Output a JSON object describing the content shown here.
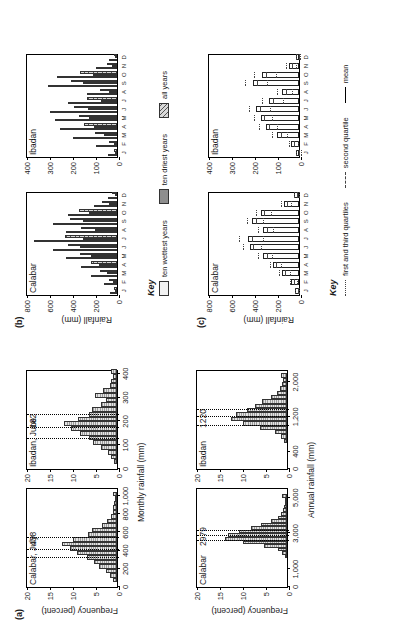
{
  "figure": {
    "orientation": "rotated-90-ccw",
    "panels": [
      "(a)",
      "(b)",
      "(c)"
    ]
  },
  "panel_a": {
    "tag": "(a)",
    "ylabel": "Frequency (percent)",
    "xlabel_top": "Monthly rainfall (mm)",
    "xlabel_bottom": "Annual rainfall (mm)",
    "charts": [
      {
        "id": "calabar-july",
        "title": "Calabar, July",
        "annotation": "438",
        "xlabel": "Monthly rainfall (mm)",
        "ylabel": "Frequency (percent)"
      },
      {
        "id": "ibadan-june",
        "title": "Ibadan, June",
        "annotation": "182",
        "xlabel": "Monthly rainfall (mm)",
        "ylabel": "Frequency (percent)"
      },
      {
        "id": "calabar-annual",
        "title": "Calabar",
        "annotation": "2979",
        "xlabel": "Annual rainfall (mm)",
        "ylabel": "Frequency (percent)"
      },
      {
        "id": "ibadan-annual",
        "title": "Ibadan",
        "annotation": "1220",
        "xlabel": "Annual rainfall (mm)",
        "ylabel": "Frequency (percent)"
      }
    ]
  },
  "panel_b": {
    "tag": "(b)",
    "ylabel": "Rainfall (mm)",
    "key_title": "Key",
    "key_items": [
      {
        "label": "ten wettest years",
        "fill": "fine-dots"
      },
      {
        "label": "ten driest years",
        "fill": "solid-gray"
      },
      {
        "label": "all years",
        "fill": "diagonal-hatch"
      }
    ],
    "charts": [
      {
        "id": "b-calabar",
        "title": "Calabar"
      },
      {
        "id": "b-ibadan",
        "title": "Ibadan"
      }
    ]
  },
  "panel_c": {
    "tag": "(c)",
    "ylabel": "Rainfall (mm)",
    "key_title": "Key",
    "key_items": [
      {
        "label": "first and third quartiles",
        "style": "dotted"
      },
      {
        "label": "second quartile",
        "style": "dashed"
      },
      {
        "label": "mean",
        "style": "solid"
      }
    ],
    "charts": [
      {
        "id": "c-calabar",
        "title": "Calabar"
      },
      {
        "id": "c-ibadan",
        "title": "Ibadan"
      }
    ]
  },
  "chart_data": [
    {
      "id": "calabar-july",
      "type": "bar",
      "title": "Calabar, July",
      "annotation": "438",
      "xlabel": "Monthly rainfall (mm)",
      "ylabel": "Frequency (percent)",
      "xlim": [
        0,
        1100
      ],
      "ylim": [
        0,
        20
      ],
      "xticks": [
        0,
        200,
        400,
        600,
        800,
        1000
      ],
      "xticklabels": [
        "0",
        "200",
        "400",
        "600",
        "800",
        "1,000"
      ],
      "yticks": [
        0,
        5,
        10,
        15,
        20
      ],
      "yticklabels": [
        "0",
        "5",
        "10",
        "15",
        "20"
      ],
      "bin_width": 50,
      "bin_starts": [
        50,
        100,
        150,
        200,
        250,
        300,
        350,
        400,
        450,
        500,
        550,
        600,
        650,
        700,
        750,
        800,
        850,
        900,
        950,
        1000
      ],
      "values": [
        0.8,
        1.6,
        2.5,
        4.0,
        5.0,
        6.5,
        8.6,
        10.2,
        12.0,
        9.6,
        6.4,
        5.4,
        3.2,
        2.2,
        1.4,
        0.9,
        0.8,
        0.6,
        0.5,
        0.9
      ],
      "stat_lines": {
        "first_quartile": 330,
        "second_quartile": 420,
        "third_quartile": 545
      }
    },
    {
      "id": "ibadan-june",
      "type": "bar",
      "title": "Ibadan, June",
      "annotation": "182",
      "xlabel": "Monthly rainfall (mm)",
      "ylabel": "Frequency (percent)",
      "xlim": [
        0,
        420
      ],
      "ylim": [
        0,
        20
      ],
      "xticks": [
        0,
        100,
        200,
        300,
        400
      ],
      "xticklabels": [
        "0",
        "100",
        "200",
        "300",
        "400"
      ],
      "yticks": [
        0,
        5,
        10,
        15,
        20
      ],
      "yticklabels": [
        "0",
        "5",
        "10",
        "15",
        "20"
      ],
      "bin_width": 20,
      "bin_starts": [
        20,
        40,
        60,
        80,
        100,
        120,
        140,
        160,
        180,
        200,
        220,
        240,
        260,
        280,
        300,
        320,
        340,
        360,
        380,
        400
      ],
      "values": [
        0.6,
        1.3,
        2.0,
        3.4,
        5.2,
        6.0,
        8.0,
        9.9,
        11.5,
        8.4,
        6.0,
        5.4,
        3.5,
        2.4,
        4.8,
        3.0,
        1.6,
        1.2,
        0.8,
        1.3
      ],
      "stat_lines": {
        "first_quartile": 130,
        "second_quartile": 178,
        "third_quartile": 232
      }
    },
    {
      "id": "calabar-annual",
      "type": "bar",
      "title": "Calabar",
      "annotation": "2979",
      "xlabel": "Annual rainfall (mm)",
      "ylabel": "Frequency (percent)",
      "xlim": [
        0,
        5600
      ],
      "ylim": [
        0,
        20
      ],
      "xticks": [
        0,
        1000,
        3000,
        5000
      ],
      "xticklabels": [
        "0",
        "1,000",
        "3,000",
        "5,000"
      ],
      "yticks": [
        0,
        5,
        10,
        15,
        20
      ],
      "yticklabels": [
        "0",
        "5",
        "10",
        "15",
        "20"
      ],
      "bin_width": 200,
      "bin_starts": [
        1600,
        1800,
        2000,
        2200,
        2400,
        2600,
        2800,
        3000,
        3200,
        3400,
        3600,
        3800,
        4000,
        4200,
        4400,
        4600,
        4800,
        5000
      ],
      "values": [
        0.5,
        1.0,
        2.0,
        5.0,
        9.6,
        13.4,
        12.8,
        10.4,
        7.8,
        5.6,
        3.4,
        2.0,
        1.2,
        0.8,
        0.6,
        0.4,
        0.4,
        1.0
      ],
      "stat_lines": {
        "first_quartile": 2620,
        "second_quartile": 2930,
        "third_quartile": 3180
      }
    },
    {
      "id": "ibadan-annual",
      "type": "bar",
      "title": "Ibadan",
      "annotation": "1220",
      "xlabel": "Annual rainfall (mm)",
      "ylabel": "Frequency (percent)",
      "xlim": [
        0,
        2300
      ],
      "ylim": [
        0,
        20
      ],
      "xticks": [
        0,
        400,
        1200,
        2000
      ],
      "xticklabels": [
        "0",
        "400",
        "1,200",
        "2,000"
      ],
      "yticks": [
        0,
        5,
        10,
        15,
        20
      ],
      "yticklabels": [
        "0",
        "5",
        "10",
        "15",
        "20"
      ],
      "bin_width": 100,
      "bin_starts": [
        600,
        700,
        800,
        900,
        1000,
        1100,
        1200,
        1300,
        1400,
        1500,
        1600,
        1700,
        1800,
        1900,
        2000,
        2100
      ],
      "values": [
        0.6,
        1.2,
        2.6,
        5.8,
        9.6,
        12.2,
        11.0,
        8.6,
        7.0,
        5.4,
        3.4,
        2.2,
        1.6,
        1.0,
        0.8,
        1.4
      ],
      "stat_lines": {
        "first_quartile": 1020,
        "second_quartile": 1210,
        "third_quartile": 1390
      }
    },
    {
      "id": "b-calabar",
      "type": "bar",
      "title": "Calabar",
      "ylabel": "Rainfall (mm)",
      "ylim": [
        0,
        800
      ],
      "yticks": [
        0,
        200,
        400,
        600,
        800
      ],
      "yticklabels": [
        "0",
        "200",
        "400",
        "600",
        "800"
      ],
      "categories": [
        "J",
        "F",
        "M",
        "A",
        "M",
        "J",
        "J",
        "A",
        "S",
        "O",
        "N",
        "D"
      ],
      "series": [
        {
          "name": "ten wettest years",
          "fill": "fine-dots",
          "values": [
            60,
            110,
            230,
            310,
            440,
            560,
            720,
            440,
            560,
            430,
            200,
            80
          ]
        },
        {
          "name": "ten driest years",
          "fill": "solid-gray",
          "values": [
            15,
            35,
            90,
            160,
            230,
            320,
            300,
            190,
            300,
            240,
            70,
            20
          ]
        },
        {
          "name": "all years",
          "fill": "diagonal-hatch",
          "values": [
            30,
            70,
            150,
            230,
            320,
            430,
            450,
            310,
            410,
            330,
            130,
            40
          ]
        }
      ]
    },
    {
      "id": "b-ibadan",
      "type": "bar",
      "title": "Ibadan",
      "ylabel": "Rainfall (mm)",
      "ylim": [
        0,
        400
      ],
      "yticks": [
        0,
        100,
        200,
        300,
        400
      ],
      "yticklabels": [
        "0",
        "100",
        "200",
        "300",
        "400"
      ],
      "categories": [
        "J",
        "F",
        "M",
        "A",
        "M",
        "J",
        "J",
        "A",
        "S",
        "O",
        "N",
        "D"
      ],
      "series": [
        {
          "name": "ten wettest years",
          "fill": "fine-dots",
          "values": [
            40,
            90,
            190,
            250,
            270,
            290,
            215,
            130,
            300,
            260,
            90,
            35
          ]
        },
        {
          "name": "ten driest years",
          "fill": "solid-gray",
          "values": [
            3,
            15,
            55,
            100,
            120,
            125,
            70,
            35,
            150,
            105,
            20,
            5
          ]
        },
        {
          "name": "all years",
          "fill": "diagonal-hatch",
          "values": [
            12,
            35,
            95,
            145,
            165,
            185,
            130,
            75,
            200,
            160,
            45,
            12
          ]
        }
      ]
    },
    {
      "id": "c-calabar",
      "type": "bar",
      "title": "Calabar",
      "ylabel": "Rainfall (mm)",
      "ylim": [
        0,
        800
      ],
      "yticks": [
        0,
        200,
        400,
        600,
        800
      ],
      "yticklabels": [
        "0",
        "200",
        "400",
        "600",
        "800"
      ],
      "categories": [
        "J",
        "F",
        "M",
        "A",
        "M",
        "J",
        "J",
        "A",
        "S",
        "O",
        "N",
        "D"
      ],
      "mean": [
        35,
        70,
        150,
        225,
        310,
        430,
        440,
        310,
        405,
        330,
        130,
        45
      ],
      "first_quartile": [
        15,
        35,
        100,
        175,
        250,
        350,
        330,
        240,
        330,
        260,
        85,
        20
      ],
      "second_quartile": [
        28,
        60,
        140,
        215,
        300,
        420,
        425,
        300,
        395,
        320,
        120,
        38
      ],
      "third_quartile": [
        52,
        100,
        195,
        270,
        370,
        505,
        540,
        375,
        470,
        395,
        170,
        62
      ]
    },
    {
      "id": "c-ibadan",
      "type": "bar",
      "title": "Ibadan",
      "ylabel": "Rainfall (mm)",
      "ylim": [
        0,
        400
      ],
      "yticks": [
        0,
        100,
        200,
        300,
        400
      ],
      "yticklabels": [
        "0",
        "100",
        "200",
        "300",
        "400"
      ],
      "categories": [
        "J",
        "F",
        "M",
        "A",
        "M",
        "J",
        "J",
        "A",
        "S",
        "O",
        "N",
        "D"
      ],
      "mean": [
        12,
        35,
        95,
        145,
        165,
        185,
        130,
        75,
        200,
        160,
        45,
        12
      ],
      "first_quartile": [
        2,
        14,
        60,
        105,
        125,
        135,
        80,
        40,
        150,
        110,
        20,
        3
      ],
      "second_quartile": [
        8,
        30,
        88,
        140,
        160,
        178,
        120,
        66,
        192,
        152,
        38,
        9
      ],
      "third_quartile": [
        20,
        52,
        125,
        182,
        205,
        228,
        170,
        105,
        245,
        205,
        65,
        20
      ]
    }
  ]
}
